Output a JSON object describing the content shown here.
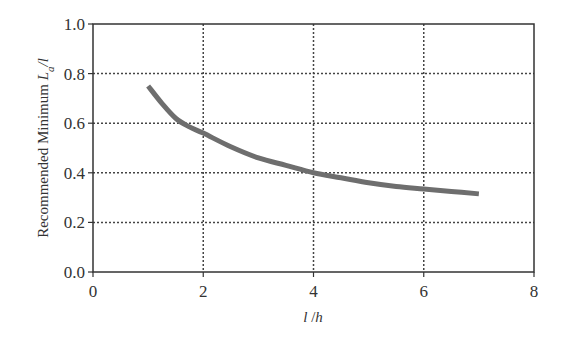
{
  "chart_data": {
    "type": "line",
    "title": "",
    "xlabel": "l /h",
    "ylabel": "Recommended Minimum L_a/l",
    "ylabel_parts": {
      "text": "Recommended Minimum ",
      "var": "L",
      "sub": "a",
      "tail": "/l"
    },
    "xlabel_parts": {
      "a": "l",
      "sep": " /",
      "b": "h"
    },
    "xlim": [
      0,
      8
    ],
    "ylim": [
      0.0,
      1.0
    ],
    "x_ticks": [
      0,
      2,
      4,
      6,
      8
    ],
    "x_tick_labels": [
      "0",
      "2",
      "4",
      "6",
      "8"
    ],
    "y_ticks": [
      0.0,
      0.2,
      0.4,
      0.6,
      0.8,
      1.0
    ],
    "y_tick_labels": [
      "0.0",
      "0.2",
      "0.4",
      "0.6",
      "0.8",
      "1.0"
    ],
    "grid": true,
    "legend": "none",
    "series": [
      {
        "name": "Recommended minimum",
        "color": "#6e6e6e",
        "x": [
          1.0,
          1.25,
          1.5,
          1.75,
          2.0,
          2.5,
          3.0,
          3.5,
          4.0,
          4.5,
          5.0,
          5.5,
          6.0,
          6.5,
          7.0
        ],
        "y": [
          0.75,
          0.68,
          0.62,
          0.585,
          0.56,
          0.505,
          0.46,
          0.43,
          0.4,
          0.38,
          0.36,
          0.345,
          0.335,
          0.325,
          0.315
        ]
      }
    ]
  }
}
